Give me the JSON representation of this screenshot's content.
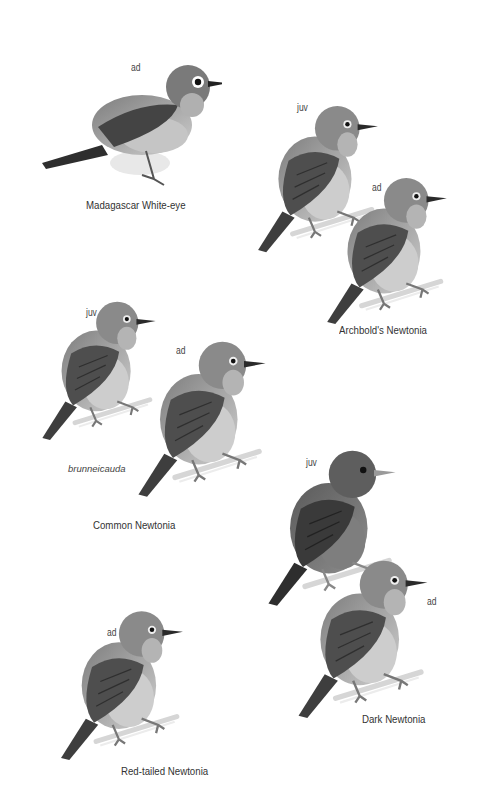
{
  "plate": {
    "species": [
      {
        "name": "Madagascar White-eye",
        "figures": [
          {
            "age": "ad"
          }
        ]
      },
      {
        "name": "Archbold's Newtonia",
        "figures": [
          {
            "age": "juv"
          },
          {
            "age": "ad"
          }
        ]
      },
      {
        "name": "Common Newtonia",
        "subspecies": "brunneicauda",
        "figures": [
          {
            "age": "juv"
          },
          {
            "age": "ad"
          }
        ]
      },
      {
        "name": "Dark Newtonia",
        "figures": [
          {
            "age": "juv"
          },
          {
            "age": "ad"
          }
        ]
      },
      {
        "name": "Red-tailed Newtonia",
        "figures": [
          {
            "age": "ad"
          }
        ]
      }
    ]
  },
  "colors": {
    "background": "#ffffff",
    "head": "#8a8a8a",
    "wing": "#4a4a4a",
    "belly": "#c8c8c8",
    "text": "#333333"
  }
}
